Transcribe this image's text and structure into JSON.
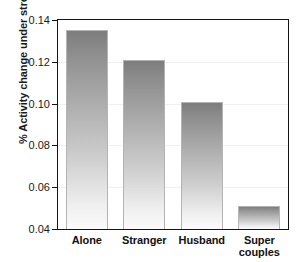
{
  "chart_data": {
    "type": "bar",
    "title": "",
    "xlabel": "",
    "ylabel": "% Activity change under stress",
    "categories": [
      "Alone",
      "Stranger",
      "Husband",
      "Super couples"
    ],
    "category_lines": [
      [
        "Alone"
      ],
      [
        "Stranger"
      ],
      [
        "Husband"
      ],
      [
        "Super",
        "couples"
      ]
    ],
    "values": [
      0.135,
      0.121,
      0.101,
      0.051
    ],
    "ylim": [
      0.04,
      0.14
    ],
    "ytick_values": [
      0.04,
      0.06,
      0.08,
      0.1,
      0.12,
      0.14
    ],
    "ytick_labels": [
      "0.04",
      "0.06",
      "0.08",
      "0.10",
      "0.12",
      "0.14"
    ],
    "grid": true,
    "legend": "none",
    "series": [
      {
        "name": "Activity change under stress",
        "values": [
          0.135,
          0.121,
          0.101,
          0.051
        ]
      }
    ],
    "colors": {
      "bar_gradient_top": "#7d7d7d",
      "bar_gradient_bottom": "#fbfbfb",
      "bar_border": "#b4b4b4",
      "axis": "#141414",
      "gridline": "#f0f0f0",
      "text": "#111111",
      "background": "#ffffff"
    }
  }
}
